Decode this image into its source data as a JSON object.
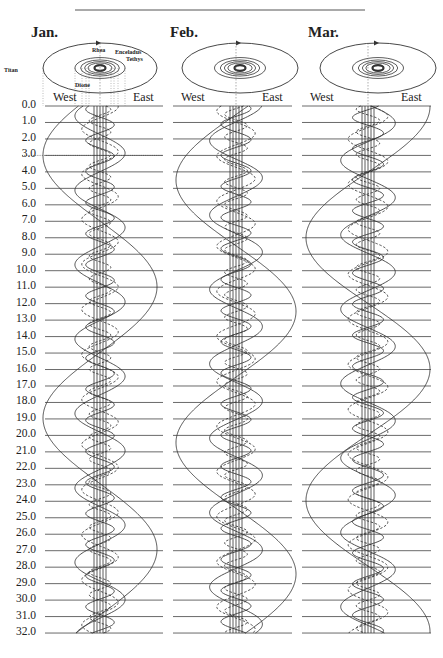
{
  "diagram": {
    "top_rule": {
      "x1": 75,
      "x2": 365,
      "y": 10
    },
    "day_axis": {
      "start": 0,
      "end": 32,
      "step": 1,
      "y_start": 106,
      "px_per_day": 16.47,
      "labels": [
        "0.0",
        "1.0",
        "2.0",
        "3.0",
        "4.0",
        "5.0",
        "6.0",
        "7.0",
        "8.0",
        "9.0",
        "10.0",
        "11.0",
        "12.0",
        "13.0",
        "14.0",
        "15.0",
        "16.0",
        "17.0",
        "18.0",
        "19.0",
        "20.0",
        "21.0",
        "22.0",
        "23.0",
        "24.0",
        "25.0",
        "26.0",
        "27.0",
        "28.0",
        "29.0",
        "30.0",
        "31.0",
        "32.0"
      ]
    },
    "directions": {
      "west": "West",
      "east": "East"
    },
    "moons": [
      {
        "name": "Titan",
        "period": 15.945,
        "amplitude_scale": 1.0,
        "dashed": false
      },
      {
        "name": "Rhea",
        "period": 4.518,
        "amplitude_scale": 0.44,
        "dashed": false
      },
      {
        "name": "Dione",
        "period": 2.737,
        "amplitude_scale": 0.32,
        "dashed": true
      },
      {
        "name": "Tethys",
        "period": 1.888,
        "amplitude_scale": 0.25,
        "dashed": false
      },
      {
        "name": "Enceladus",
        "period": 1.37,
        "amplitude_scale": 0.19,
        "dashed": true
      }
    ],
    "panels": [
      {
        "month": "Jan.",
        "center_x": 100,
        "amplitude": 57,
        "line_x1": 45,
        "line_x2": 163,
        "ellipse": {
          "cx": 100,
          "cy": 68,
          "rx": 57,
          "ry": 25
        },
        "phases": [
          3.0,
          0.6,
          1.4,
          0.2,
          0.9
        ],
        "moon_labels": [
          {
            "name": "Titan",
            "x": 4,
            "y": 67
          },
          {
            "name": "Rhea",
            "x": 92,
            "y": 47
          },
          {
            "name": "Enceladus",
            "x": 115,
            "y": 49
          },
          {
            "name": "Tethys",
            "x": 126,
            "y": 56
          },
          {
            "name": "Dione",
            "x": 75,
            "y": 82
          }
        ],
        "dotted_marker_day": 3.0
      },
      {
        "month": "Feb.",
        "center_x": 236,
        "amplitude": 60,
        "line_x1": 173,
        "line_x2": 292,
        "ellipse": {
          "cx": 240,
          "cy": 68,
          "rx": 58,
          "ry": 25
        },
        "phases": [
          4.5,
          2.1,
          0.3,
          1.1,
          0.5
        ],
        "moon_labels": []
      },
      {
        "month": "Mar.",
        "center_x": 368,
        "amplitude": 62,
        "line_x1": 302,
        "line_x2": 431,
        "ellipse": {
          "cx": 378,
          "cy": 68,
          "rx": 58,
          "ry": 25
        },
        "phases": [
          8.0,
          3.3,
          2.0,
          0.7,
          0.2
        ],
        "moon_labels": []
      }
    ]
  },
  "colors": {
    "ink": "#333333",
    "grid": "#444444",
    "background": "#ffffff"
  }
}
